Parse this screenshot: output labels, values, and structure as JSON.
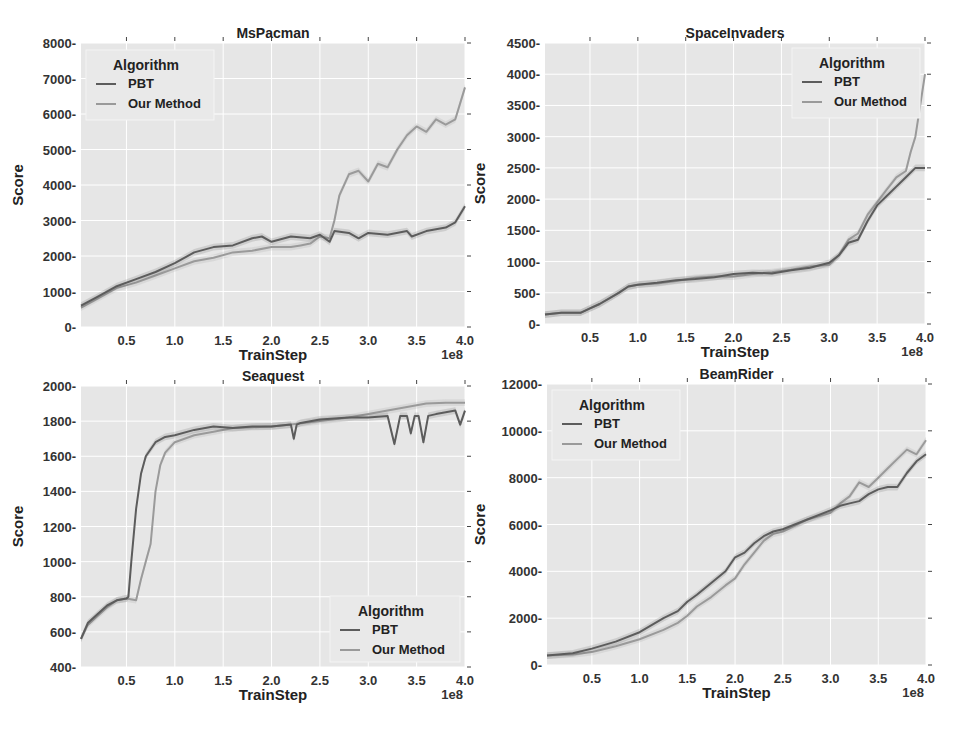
{
  "figure": {
    "background": "#ffffff",
    "plot_background": "#e6e6e6",
    "grid_color": "#ffffff",
    "colors": {
      "PBT": "#5c5c5c",
      "Our Method": "#9a9a9a"
    }
  },
  "chart_data": [
    {
      "type": "line",
      "title": "MsPacman",
      "xlabel": "TrainStep",
      "ylabel": "Score",
      "x_offset_label": "1e8",
      "xlim": [
        0.03,
        4.0
      ],
      "ylim": [
        0,
        8000
      ],
      "xticks": [
        "0.5",
        "1.0",
        "1.5",
        "2.0",
        "2.5",
        "3.0",
        "3.5",
        "4.0"
      ],
      "yticks": [
        "0",
        "1000",
        "2000",
        "3000",
        "4000",
        "5000",
        "6000",
        "7000",
        "8000"
      ],
      "grid": true,
      "legend": {
        "title": "Algorithm",
        "position": "upper left",
        "entries": [
          "PBT",
          "Our Method"
        ]
      },
      "series": [
        {
          "name": "PBT",
          "x": [
            0.03,
            0.2,
            0.4,
            0.6,
            0.8,
            1.0,
            1.2,
            1.4,
            1.6,
            1.8,
            1.9,
            2.0,
            2.2,
            2.4,
            2.5,
            2.6,
            2.65,
            2.8,
            2.9,
            3.0,
            3.2,
            3.4,
            3.45,
            3.6,
            3.8,
            3.9,
            4.0
          ],
          "y": [
            600,
            850,
            1150,
            1350,
            1550,
            1800,
            2100,
            2250,
            2300,
            2500,
            2550,
            2400,
            2550,
            2500,
            2600,
            2400,
            2700,
            2650,
            2500,
            2650,
            2600,
            2700,
            2550,
            2700,
            2800,
            2950,
            3400
          ]
        },
        {
          "name": "Our Method",
          "x": [
            0.03,
            0.2,
            0.4,
            0.6,
            0.8,
            1.0,
            1.2,
            1.4,
            1.6,
            1.8,
            2.0,
            2.2,
            2.3,
            2.4,
            2.5,
            2.6,
            2.65,
            2.7,
            2.8,
            2.9,
            3.0,
            3.1,
            3.2,
            3.3,
            3.4,
            3.5,
            3.6,
            3.7,
            3.8,
            3.9,
            4.0
          ],
          "y": [
            550,
            800,
            1100,
            1250,
            1450,
            1650,
            1850,
            1950,
            2100,
            2150,
            2250,
            2250,
            2300,
            2350,
            2550,
            2500,
            3000,
            3700,
            4300,
            4400,
            4100,
            4600,
            4500,
            5000,
            5400,
            5650,
            5500,
            5850,
            5700,
            5850,
            6750
          ]
        }
      ]
    },
    {
      "type": "line",
      "title": "SpaceInvaders",
      "xlabel": "TrainStep",
      "ylabel": "Score",
      "x_offset_label": "1e8",
      "xlim": [
        0.03,
        4.0
      ],
      "ylim": [
        0,
        4500
      ],
      "xticks": [
        "0.5",
        "1.0",
        "1.5",
        "2.0",
        "2.5",
        "3.0",
        "3.5",
        "4.0"
      ],
      "yticks": [
        "0",
        "500",
        "1000",
        "1500",
        "2000",
        "2500",
        "3000",
        "3500",
        "4000",
        "4500"
      ],
      "grid": true,
      "legend": {
        "title": "Algorithm",
        "position": "upper right",
        "entries": [
          "PBT",
          "Our Method"
        ]
      },
      "series": [
        {
          "name": "PBT",
          "x": [
            0.03,
            0.2,
            0.4,
            0.5,
            0.6,
            0.8,
            0.9,
            1.0,
            1.2,
            1.4,
            1.6,
            1.8,
            2.0,
            2.2,
            2.4,
            2.6,
            2.8,
            3.0,
            3.1,
            3.2,
            3.3,
            3.4,
            3.5,
            3.6,
            3.7,
            3.8,
            3.9,
            4.0
          ],
          "y": [
            150,
            180,
            180,
            250,
            320,
            500,
            600,
            630,
            660,
            700,
            720,
            750,
            800,
            820,
            810,
            860,
            900,
            980,
            1100,
            1300,
            1350,
            1650,
            1900,
            2050,
            2200,
            2350,
            2500,
            2500
          ]
        },
        {
          "name": "Our Method",
          "x": [
            0.03,
            0.2,
            0.4,
            0.5,
            0.6,
            0.8,
            0.9,
            1.0,
            1.2,
            1.4,
            1.6,
            1.8,
            2.0,
            2.2,
            2.4,
            2.6,
            2.8,
            3.0,
            3.1,
            3.2,
            3.3,
            3.4,
            3.5,
            3.6,
            3.7,
            3.8,
            3.85,
            3.9,
            4.0
          ],
          "y": [
            150,
            180,
            180,
            250,
            320,
            500,
            600,
            630,
            650,
            690,
            740,
            760,
            760,
            800,
            830,
            870,
            920,
            950,
            1100,
            1350,
            1450,
            1750,
            1950,
            2150,
            2350,
            2450,
            2750,
            3000,
            4000
          ]
        }
      ]
    },
    {
      "type": "line",
      "title": "Seaquest",
      "xlabel": "TrainStep",
      "ylabel": "Score",
      "x_offset_label": "1e8",
      "xlim": [
        0.03,
        4.0
      ],
      "ylim": [
        400,
        2000
      ],
      "xticks": [
        "0.5",
        "1.0",
        "1.5",
        "2.0",
        "2.5",
        "3.0",
        "3.5",
        "4.0"
      ],
      "yticks": [
        "400",
        "600",
        "800",
        "1000",
        "1200",
        "1400",
        "1600",
        "1800",
        "2000"
      ],
      "grid": true,
      "legend": {
        "title": "Algorithm",
        "position": "lower right",
        "entries": [
          "PBT",
          "Our Method"
        ]
      },
      "series": [
        {
          "name": "PBT",
          "x": [
            0.03,
            0.1,
            0.2,
            0.3,
            0.4,
            0.5,
            0.52,
            0.55,
            0.6,
            0.65,
            0.7,
            0.8,
            0.9,
            1.0,
            1.2,
            1.4,
            1.6,
            1.8,
            2.0,
            2.2,
            2.23,
            2.26,
            2.3,
            2.5,
            2.8,
            3.0,
            3.2,
            3.27,
            3.33,
            3.4,
            3.44,
            3.48,
            3.52,
            3.57,
            3.62,
            3.7,
            3.8,
            3.9,
            3.95,
            4.0
          ],
          "y": [
            560,
            650,
            700,
            750,
            780,
            790,
            800,
            1000,
            1300,
            1500,
            1600,
            1680,
            1710,
            1720,
            1750,
            1770,
            1760,
            1770,
            1770,
            1780,
            1700,
            1780,
            1790,
            1810,
            1820,
            1820,
            1830,
            1670,
            1830,
            1830,
            1730,
            1830,
            1830,
            1680,
            1830,
            1840,
            1850,
            1860,
            1780,
            1860
          ]
        },
        {
          "name": "Our Method",
          "x": [
            0.03,
            0.1,
            0.2,
            0.3,
            0.4,
            0.5,
            0.6,
            0.65,
            0.7,
            0.75,
            0.8,
            0.85,
            0.9,
            1.0,
            1.2,
            1.4,
            1.6,
            1.8,
            2.0,
            2.2,
            2.5,
            2.8,
            3.0,
            3.2,
            3.4,
            3.6,
            3.8,
            4.0
          ],
          "y": [
            560,
            640,
            690,
            740,
            780,
            790,
            780,
            900,
            1000,
            1100,
            1400,
            1550,
            1620,
            1680,
            1720,
            1740,
            1760,
            1765,
            1770,
            1780,
            1800,
            1820,
            1840,
            1860,
            1880,
            1900,
            1905,
            1905
          ]
        }
      ]
    },
    {
      "type": "line",
      "title": "BeamRider",
      "xlabel": "TrainStep",
      "ylabel": "Score",
      "x_offset_label": "1e8",
      "xlim": [
        0.03,
        4.0
      ],
      "ylim": [
        0,
        12000
      ],
      "xticks": [
        "0.5",
        "1.0",
        "1.5",
        "2.0",
        "2.5",
        "3.0",
        "3.5",
        "4.0"
      ],
      "yticks": [
        "0",
        "2000",
        "4000",
        "6000",
        "8000",
        "10000",
        "12000"
      ],
      "grid": true,
      "legend": {
        "title": "Algorithm",
        "position": "upper left",
        "entries": [
          "PBT",
          "Our Method"
        ]
      },
      "series": [
        {
          "name": "PBT",
          "x": [
            0.03,
            0.3,
            0.5,
            0.75,
            1.0,
            1.25,
            1.4,
            1.5,
            1.6,
            1.75,
            1.9,
            2.0,
            2.1,
            2.2,
            2.3,
            2.4,
            2.5,
            2.75,
            3.0,
            3.1,
            3.2,
            3.3,
            3.4,
            3.5,
            3.6,
            3.7,
            3.8,
            3.9,
            4.0
          ],
          "y": [
            400,
            500,
            700,
            1000,
            1400,
            2000,
            2300,
            2700,
            3000,
            3500,
            4000,
            4600,
            4800,
            5200,
            5500,
            5700,
            5800,
            6200,
            6600,
            6800,
            6900,
            7000,
            7300,
            7500,
            7600,
            7600,
            8200,
            8700,
            9000
          ]
        },
        {
          "name": "Our Method",
          "x": [
            0.03,
            0.3,
            0.5,
            0.75,
            1.0,
            1.25,
            1.4,
            1.5,
            1.6,
            1.75,
            1.9,
            2.0,
            2.1,
            2.2,
            2.3,
            2.4,
            2.5,
            2.75,
            3.0,
            3.1,
            3.2,
            3.3,
            3.4,
            3.5,
            3.6,
            3.7,
            3.8,
            3.9,
            4.0
          ],
          "y": [
            400,
            450,
            550,
            800,
            1100,
            1500,
            1800,
            2100,
            2500,
            2900,
            3400,
            3700,
            4300,
            4800,
            5300,
            5600,
            5700,
            6200,
            6500,
            6900,
            7200,
            7800,
            7600,
            8000,
            8400,
            8800,
            9200,
            9000,
            9600
          ]
        }
      ]
    }
  ]
}
